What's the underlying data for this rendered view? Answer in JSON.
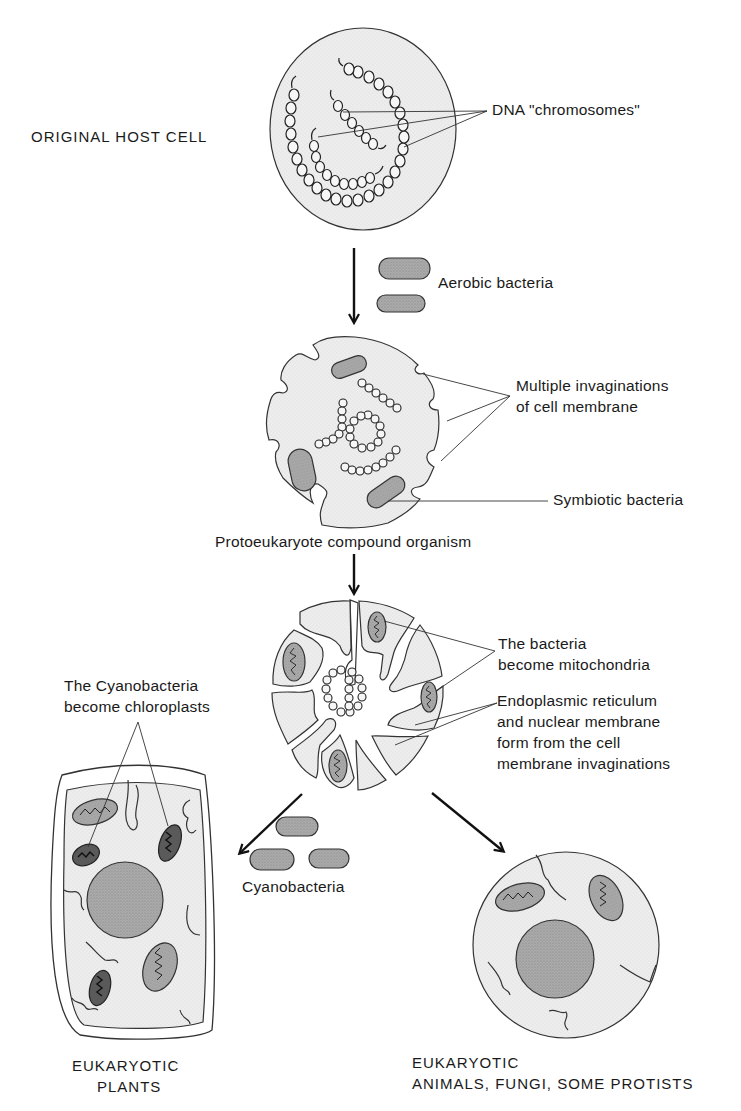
{
  "diagram": {
    "type": "endosymbiotic-theory-flow",
    "colors": {
      "line": "#222222",
      "cytoplasm": "#ececec",
      "organelle": "#a8a8a8",
      "nucleus": "#a5a5a5",
      "background": "#ffffff"
    },
    "stages": [
      {
        "id": "host-cell",
        "label": "ORIGINAL HOST CELL",
        "callouts": [
          "DNA \"chromosomes\""
        ]
      },
      {
        "id": "input-aerobic",
        "label": "Aerobic bacteria"
      },
      {
        "id": "protoeukaryote",
        "label": "Protoeukaryote compound organism",
        "callouts": [
          "Multiple invaginations",
          "of cell membrane",
          "Symbiotic bacteria"
        ]
      },
      {
        "id": "early-eukaryote",
        "callouts": [
          "The bacteria",
          "become mitochondria",
          "Endoplasmic reticulum",
          "and nuclear membrane",
          "form from the cell",
          "membrane invaginations"
        ]
      },
      {
        "id": "input-cyanobacteria",
        "label": "Cyanobacteria"
      },
      {
        "id": "plant-cell",
        "label_line1": "EUKARYOTIC",
        "label_line2": "PLANTS",
        "callouts": [
          "The Cyanobacteria",
          "become chloroplasts"
        ]
      },
      {
        "id": "animal-cell",
        "label_line1": "EUKARYOTIC",
        "label_line2": "ANIMALS, FUNGI, SOME PROTISTS"
      }
    ]
  }
}
